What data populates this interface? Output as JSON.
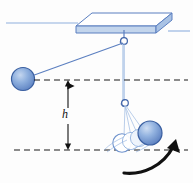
{
  "figure": {
    "type": "physics-diagram",
    "labels": {
      "height": "h"
    },
    "colors": {
      "ball_fill": "#7a9ed6",
      "ball_edge": "#3a5fa0",
      "slab_side": "#b9cde9",
      "slab_top": "#ffffff",
      "slab_edge": "#5b7fc0",
      "string": "#5b7fc0",
      "rule_line": "#8fb0de",
      "dashed": "#1a1a1a",
      "arrow": "#111111",
      "ghost_edge": "#6f93cd"
    },
    "elements": {
      "ceiling_slab": "ceiling-slab",
      "pivot_hook": "pivot-hook",
      "raised_ball": "raised-ball",
      "string_raised": "string-to-raised-ball",
      "string_vertical": "vertical-string",
      "lower_hook": "lower-pivot-hook",
      "swing_ball": "swinging-ball",
      "ghost_balls": "motion-trail-balls",
      "top_dashed_line": "upper-reference-line",
      "bottom_dashed_line": "lower-reference-line",
      "height_arrow": "height-dimension-arrow",
      "direction_arrow": "swing-direction-arrow"
    }
  }
}
